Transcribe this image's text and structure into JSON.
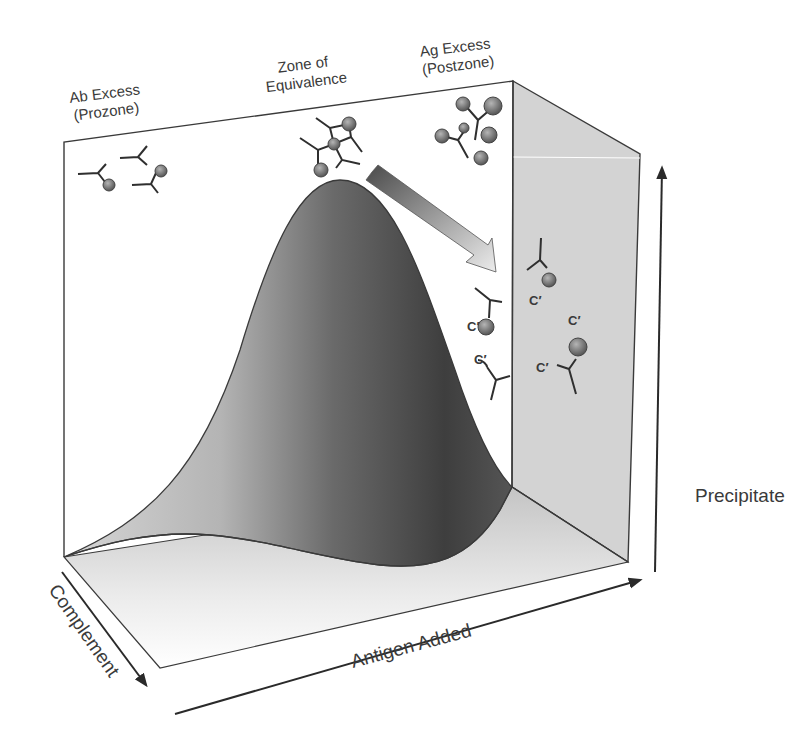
{
  "diagram": {
    "type": "3d-precipitation-curve",
    "zones": [
      {
        "id": "prozone",
        "line1": "Ab Excess",
        "line2": "(Prozone)"
      },
      {
        "id": "equivalence",
        "line1": "Zone of",
        "line2": "Equivalence"
      },
      {
        "id": "postzone",
        "line1": "Ag Excess",
        "line2": "(Postzone)"
      }
    ],
    "axes": {
      "x": "Antigen Added",
      "y": "Precipitate",
      "z": "Complement"
    },
    "complement_labels": [
      "C′",
      "C′",
      "C′",
      "C′",
      "C′"
    ],
    "colors": {
      "line": "#3a3a3a",
      "wall": "#cfcfcf",
      "curve_dark": "#3c3c3c",
      "curve_light": "#c8c8c8",
      "molecule": "#6e6e6e"
    }
  }
}
